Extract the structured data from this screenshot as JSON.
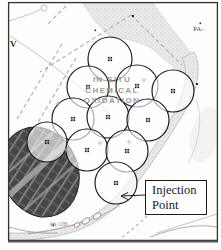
{
  "figure": {
    "title_overlay": {
      "line1": "IN SITU",
      "line2": "CHEMICAL",
      "line3": "OXIDATION"
    },
    "callout": {
      "line1": "Injection",
      "line2": "Point"
    },
    "annotations": {
      "top_right_well": "PA-",
      "left_mark": "V",
      "bottom_well": "PA-12B"
    },
    "injection_points": [
      {
        "x": 110,
        "y": 59,
        "r": 22
      },
      {
        "x": 88,
        "y": 87,
        "r": 21
      },
      {
        "x": 137,
        "y": 86,
        "r": 21
      },
      {
        "x": 173,
        "y": 91,
        "r": 21
      },
      {
        "x": 73,
        "y": 119,
        "r": 21
      },
      {
        "x": 108,
        "y": 117,
        "r": 21
      },
      {
        "x": 148,
        "y": 120,
        "r": 21
      },
      {
        "x": 47,
        "y": 142,
        "r": 20
      },
      {
        "x": 87,
        "y": 150,
        "r": 21
      },
      {
        "x": 127,
        "y": 151,
        "r": 21
      },
      {
        "x": 116,
        "y": 183,
        "r": 21
      }
    ],
    "colors": {
      "frame": "#333333",
      "circle_stroke": "#1f1f1f",
      "stipple_dot": "#b9b9b6",
      "excavation_fill": "#474747",
      "dashed_line": "#adadad",
      "area_text": "#9c9c9c"
    }
  }
}
